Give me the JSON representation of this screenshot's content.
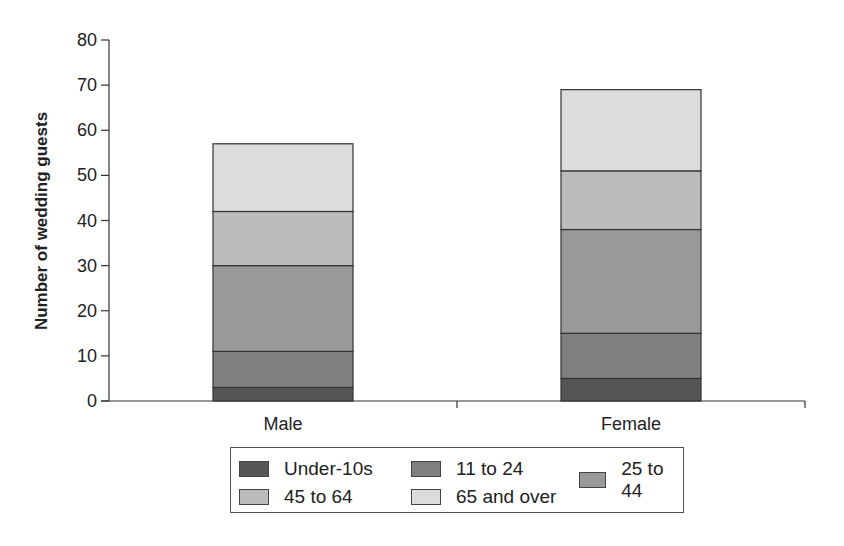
{
  "chart_data": {
    "type": "bar",
    "stacked": true,
    "title": "",
    "xlabel": "",
    "ylabel": "Number of wedding guests",
    "ylim": [
      0,
      80
    ],
    "yticks": [
      0,
      10,
      20,
      30,
      40,
      50,
      60,
      70,
      80
    ],
    "categories": [
      "Male",
      "Female"
    ],
    "series": [
      {
        "name": "Under-10s",
        "values": [
          3,
          5
        ],
        "color": "#555555"
      },
      {
        "name": "11 to 24",
        "values": [
          8,
          10
        ],
        "color": "#7f7f7f"
      },
      {
        "name": "25 to 44",
        "values": [
          19,
          23
        ],
        "color": "#999999"
      },
      {
        "name": "45 to 64",
        "values": [
          12,
          13
        ],
        "color": "#bcbcbc"
      },
      {
        "name": "65 and over",
        "values": [
          15,
          18
        ],
        "color": "#dcdcdc"
      }
    ],
    "totals": [
      57,
      69
    ],
    "grid": false,
    "legend_position": "bottom"
  }
}
